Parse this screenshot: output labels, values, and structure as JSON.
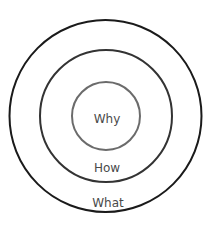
{
  "diagram": {
    "rings": [
      {
        "id": "why",
        "label": "Why",
        "cx": 106,
        "cy": 116,
        "r": 34,
        "stroke": "#6b6b6b",
        "stroke_width": 2
      },
      {
        "id": "how",
        "label": "How",
        "cx": 106,
        "cy": 116,
        "r": 66,
        "stroke": "#333333",
        "stroke_width": 2
      },
      {
        "id": "what",
        "label": "What",
        "cx": 105.5,
        "cy": 116,
        "r": 96,
        "stroke": "#1a1a1a",
        "stroke_width": 2
      }
    ],
    "labels": {
      "why": "Why",
      "how": "How",
      "what": "What"
    },
    "colors": {
      "background": "#ffffff",
      "text": "#4a4a4a"
    }
  }
}
